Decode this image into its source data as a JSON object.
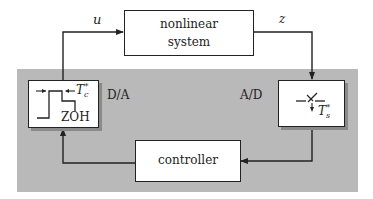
{
  "diagram": {
    "type": "sampled-data control loop block diagram",
    "colors": {
      "background": "#ffffff",
      "digital_region": "#b9b9b9",
      "block_fill": "#ffffff",
      "line": "#222222",
      "shadow": "#8a8a8a"
    },
    "blocks": {
      "plant": {
        "line1": "nonlinear",
        "line2": "system"
      },
      "dac": {
        "name": "ZOH",
        "side_label": "D/A",
        "period_symbol": "T",
        "period_sub": "c",
        "period_sup": "*"
      },
      "adc": {
        "side_label": "A/D",
        "period_symbol": "T",
        "period_sub": "s",
        "period_sup": "*"
      },
      "controller": {
        "label": "controller"
      }
    },
    "signals": {
      "input": "u",
      "output": "z"
    },
    "connections": [
      {
        "from": "ZOH",
        "to": "nonlinear system",
        "label": "u"
      },
      {
        "from": "nonlinear system",
        "to": "A/D",
        "label": "z"
      },
      {
        "from": "A/D",
        "to": "controller",
        "label": ""
      },
      {
        "from": "controller",
        "to": "ZOH",
        "label": ""
      }
    ]
  }
}
